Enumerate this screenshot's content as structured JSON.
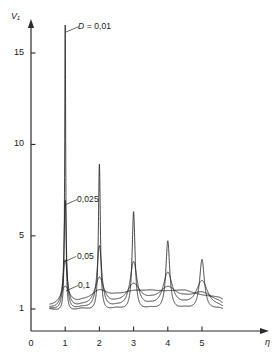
{
  "chart_data": {
    "type": "line",
    "title": "",
    "subtitle": "",
    "xlabel": "η",
    "ylabel": "V₁",
    "xlim": [
      0,
      5.75
    ],
    "ylim": [
      0,
      17
    ],
    "grid": false,
    "legend_position": "inline-annotations",
    "x_ticks": [
      "0",
      "1",
      "2",
      "3",
      "4",
      "5"
    ],
    "x_tick_values": [
      0,
      1,
      2,
      3,
      4,
      5
    ],
    "y_ticks": [
      "1",
      "5",
      "10",
      "15"
    ],
    "y_tick_values": [
      1,
      5,
      10,
      15
    ],
    "annotations": [
      {
        "text": "D = 0,01",
        "value": 0.01,
        "x": 1.0,
        "y": 16.2
      },
      {
        "text": "0,025",
        "value": 0.025,
        "x": 1.0,
        "y": 6.6
      },
      {
        "text": "0,05",
        "value": 0.05,
        "x": 1.0,
        "y": 3.3
      },
      {
        "text": "0,1",
        "value": 0.1,
        "x": 1.0,
        "y": 1.75
      }
    ],
    "series": [
      {
        "name": "D = 0,01",
        "damping": 0.01,
        "peak_positions": [
          1,
          2,
          3,
          4,
          5
        ],
        "peak_values": [
          16.5,
          8.6,
          6.0,
          4.4,
          3.4
        ]
      },
      {
        "name": "0,025",
        "damping": 0.025,
        "peak_positions": [
          1,
          2,
          3,
          4,
          5
        ],
        "peak_values": [
          6.6,
          4.1,
          3.2,
          2.6,
          2.2
        ]
      },
      {
        "name": "0,05",
        "damping": 0.05,
        "peak_positions": [
          1,
          2,
          3,
          4,
          5
        ],
        "peak_values": [
          3.3,
          2.3,
          1.9,
          1.7,
          1.5
        ]
      },
      {
        "name": "0,1",
        "damping": 0.1,
        "peak_positions": [
          1,
          2,
          3,
          4,
          5
        ],
        "peak_values": [
          1.75,
          1.45,
          1.3,
          1.25,
          1.2
        ]
      }
    ],
    "baseline_value": 1,
    "x_domain_start": 0.55,
    "x_domain_end": 5.6
  },
  "axes": {
    "y_title": "V₁",
    "x_title": "η"
  }
}
